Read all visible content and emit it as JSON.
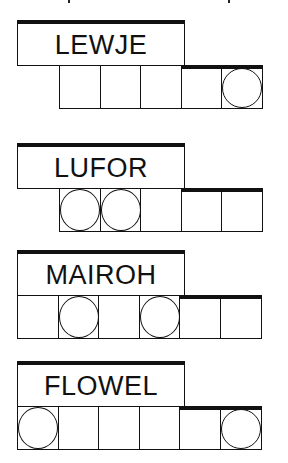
{
  "puzzle_title": "Word jumble puzzle",
  "puzzles": [
    {
      "scrambled": "LEWJE",
      "cells": 5,
      "circled": [
        5
      ],
      "highlighted_top": [
        4,
        5
      ]
    },
    {
      "scrambled": "LUFOR",
      "cells": 5,
      "circled": [
        1,
        2
      ],
      "highlighted_top": [
        4,
        5
      ]
    },
    {
      "scrambled": "MAIROH",
      "cells": 6,
      "circled": [
        2,
        4
      ],
      "highlighted_top": [
        5,
        6
      ]
    },
    {
      "scrambled": "FLOWEL",
      "cells": 6,
      "circled": [
        1,
        6
      ],
      "highlighted_top": [
        5,
        6
      ]
    }
  ],
  "colors": {
    "ink": "#111111",
    "background": "#ffffff"
  }
}
